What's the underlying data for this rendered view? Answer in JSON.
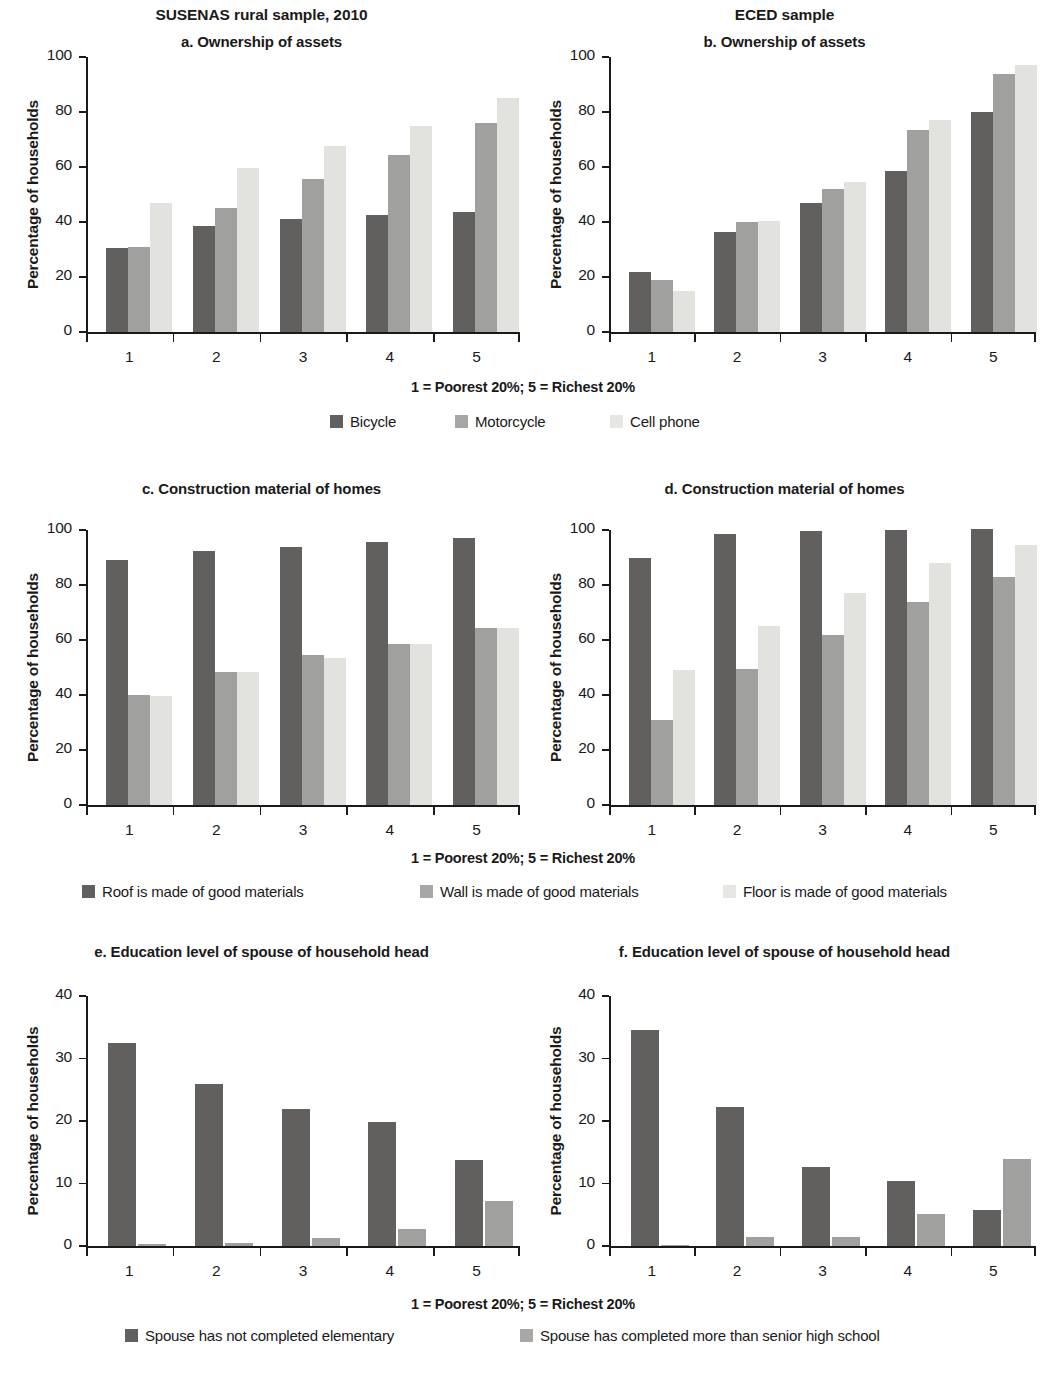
{
  "figure": {
    "column_titles": [
      "SUSENAS rural sample, 2010",
      "ECED sample"
    ],
    "axis_caption": "1 = Poorest 20%; 5 = Richest 20%",
    "ylabel": "Percentage of households",
    "colors": {
      "series_dark": "#61605f",
      "series_medium": "#a0a09e",
      "series_light": "#e2e2df",
      "axis": "#1a1a1a",
      "text": "#1a1a1a",
      "background": "#ffffff"
    }
  },
  "rows": [
    {
      "axis_caption": "1 = Poorest 20%; 5 = Richest 20%",
      "legend": [
        "Bicycle",
        "Motorcycle",
        "Cell phone"
      ]
    },
    {
      "axis_caption": "1 = Poorest 20%; 5 = Richest 20%",
      "legend": [
        "Roof is made of good materials",
        "Wall is made of good materials",
        "Floor is made of good materials"
      ]
    },
    {
      "axis_caption": "1 = Poorest 20%; 5 = Richest 20%",
      "legend": [
        "Spouse has not completed elementary",
        "Spouse has completed more than senior high school"
      ]
    }
  ],
  "chart_data": [
    {
      "id": "a",
      "type": "bar",
      "title": "a. Ownership of assets",
      "sample": "SUSENAS rural sample, 2010",
      "xlabel": "1 = Poorest 20%; 5 = Richest 20%",
      "ylabel": "Percentage of households",
      "categories": [
        "1",
        "2",
        "3",
        "4",
        "5"
      ],
      "yticks": [
        0,
        20,
        40,
        60,
        80,
        100
      ],
      "ylim": [
        0,
        100
      ],
      "grid": false,
      "legend_position": "bottom",
      "series": [
        {
          "name": "Bicycle",
          "values": [
            30.5,
            38.5,
            41.0,
            42.5,
            43.5
          ]
        },
        {
          "name": "Motorcycle",
          "values": [
            31.0,
            45.0,
            55.5,
            64.5,
            76.0
          ]
        },
        {
          "name": "Cell phone",
          "values": [
            47.0,
            59.5,
            67.5,
            75.0,
            85.0
          ]
        }
      ]
    },
    {
      "id": "b",
      "type": "bar",
      "title": "b. Ownership of assets",
      "sample": "ECED sample",
      "xlabel": "1 = Poorest 20%; 5 = Richest 20%",
      "ylabel": "Percentage of households",
      "categories": [
        "1",
        "2",
        "3",
        "4",
        "5"
      ],
      "yticks": [
        0,
        20,
        40,
        60,
        80,
        100
      ],
      "ylim": [
        0,
        100
      ],
      "grid": false,
      "legend_position": "bottom",
      "series": [
        {
          "name": "Bicycle",
          "values": [
            22.0,
            36.5,
            47.0,
            58.5,
            80.0
          ]
        },
        {
          "name": "Motorcycle",
          "values": [
            19.0,
            40.0,
            52.0,
            73.5,
            94.0
          ]
        },
        {
          "name": "Cell phone",
          "values": [
            15.0,
            40.5,
            54.5,
            77.0,
            97.0
          ]
        }
      ]
    },
    {
      "id": "c",
      "type": "bar",
      "title": "c. Construction material of homes",
      "sample": "SUSENAS rural sample, 2010",
      "xlabel": "1 = Poorest 20%; 5 = Richest 20%",
      "ylabel": "Percentage of households",
      "categories": [
        "1",
        "2",
        "3",
        "4",
        "5"
      ],
      "yticks": [
        0,
        20,
        40,
        60,
        80,
        100
      ],
      "ylim": [
        0,
        100
      ],
      "grid": false,
      "legend_position": "bottom",
      "series": [
        {
          "name": "Roof is made of good materials",
          "values": [
            89.0,
            92.5,
            94.0,
            95.5,
            97.0
          ]
        },
        {
          "name": "Wall is made of good materials",
          "values": [
            40.0,
            48.5,
            54.5,
            58.5,
            64.5
          ]
        },
        {
          "name": "Floor is made of good materials",
          "values": [
            39.5,
            48.5,
            53.5,
            58.5,
            64.5
          ]
        }
      ]
    },
    {
      "id": "d",
      "type": "bar",
      "title": "d. Construction material of homes",
      "sample": "ECED sample",
      "xlabel": "1 = Poorest 20%; 5 = Richest 20%",
      "ylabel": "Percentage of households",
      "categories": [
        "1",
        "2",
        "3",
        "4",
        "5"
      ],
      "yticks": [
        0,
        20,
        40,
        60,
        80,
        100
      ],
      "ylim": [
        0,
        100
      ],
      "grid": false,
      "legend_position": "bottom",
      "series": [
        {
          "name": "Roof is made of good materials",
          "values": [
            90.0,
            98.5,
            99.5,
            100.0,
            100.5
          ]
        },
        {
          "name": "Wall is made of good materials",
          "values": [
            31.0,
            49.5,
            62.0,
            74.0,
            83.0
          ]
        },
        {
          "name": "Floor is made of good materials",
          "values": [
            49.0,
            65.0,
            77.0,
            88.0,
            94.5
          ]
        }
      ]
    },
    {
      "id": "e",
      "type": "bar",
      "title": "e. Education level of spouse of household head",
      "sample": "SUSENAS rural sample, 2010",
      "xlabel": "1 = Poorest 20%; 5 = Richest 20%",
      "ylabel": "Percentage of households",
      "categories": [
        "1",
        "2",
        "3",
        "4",
        "5"
      ],
      "yticks": [
        0,
        10,
        20,
        30,
        40
      ],
      "ylim": [
        0,
        40
      ],
      "grid": false,
      "legend_position": "bottom",
      "series": [
        {
          "name": "Spouse has not completed elementary",
          "values": [
            32.5,
            26.0,
            22.0,
            19.8,
            13.8
          ]
        },
        {
          "name": "Spouse has completed more than senior high school",
          "values": [
            0.3,
            0.5,
            1.3,
            2.7,
            7.2
          ]
        }
      ]
    },
    {
      "id": "f",
      "type": "bar",
      "title": "f. Education level of spouse of household head",
      "sample": "ECED sample",
      "xlabel": "1 = Poorest 20%; 5 = Richest 20%",
      "ylabel": "Percentage of households",
      "categories": [
        "1",
        "2",
        "3",
        "4",
        "5"
      ],
      "yticks": [
        0,
        10,
        20,
        30,
        40
      ],
      "ylim": [
        0,
        40
      ],
      "grid": false,
      "legend_position": "bottom",
      "series": [
        {
          "name": "Spouse has not completed elementary",
          "values": [
            34.6,
            22.2,
            12.6,
            10.4,
            5.8
          ]
        },
        {
          "name": "Spouse has completed more than senior high school",
          "values": [
            0.2,
            1.4,
            1.4,
            5.2,
            14.0
          ]
        }
      ]
    }
  ]
}
